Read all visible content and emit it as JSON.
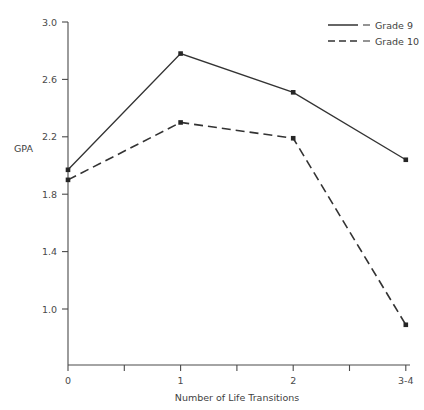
{
  "chart_data": {
    "type": "line",
    "title": "",
    "xlabel": "Number of Life Transitions",
    "ylabel": "GPA",
    "categories": [
      "0",
      "1",
      "2",
      "3-4"
    ],
    "xticklabels": [
      "0",
      "1",
      "2",
      "3-4"
    ],
    "yticklabels": [
      "1.0",
      "1.4",
      "1.8",
      "2.2",
      "2.6",
      "3.0"
    ],
    "ytickvalues": [
      1.0,
      1.4,
      1.8,
      2.2,
      2.6,
      3.0
    ],
    "ylim": [
      0.6,
      3.0
    ],
    "xlim": [
      0,
      3
    ],
    "grid": false,
    "legend_position": "top-right",
    "minor_xticks": true,
    "series": [
      {
        "name": "Grade 9",
        "style": "solid",
        "marker": "square",
        "color": "#333333",
        "values": [
          1.97,
          2.78,
          2.51,
          2.04
        ]
      },
      {
        "name": "Grade 10",
        "style": "dashed",
        "marker": "square",
        "color": "#333333",
        "values": [
          1.9,
          2.3,
          2.19,
          0.89
        ]
      }
    ]
  },
  "legend": {
    "entries": [
      {
        "label": "Grade 9"
      },
      {
        "label": "Grade 10"
      }
    ]
  },
  "axes": {
    "y_axis_title": "GPA",
    "x_axis_title": "Number of Life Transitions"
  }
}
